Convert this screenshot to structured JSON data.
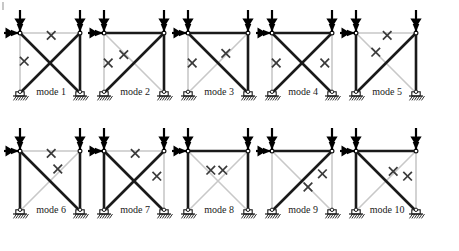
{
  "figure": {
    "kind": "truss-collapse-mode-diagram",
    "rows": 2,
    "columns": 5,
    "colors": {
      "intact_member": "#1a1a1a",
      "failed_member": "#c8c8c8",
      "failure_mark": "#3a3a3a",
      "load_arrow": "#000000",
      "background": "#ffffff",
      "support_hatch": "#1a1a1a"
    },
    "legend": {
      "failure_mark_glyph": "×",
      "failure_mark_meaning": "plastic hinge / member failure",
      "gray_member_meaning": "failed member",
      "dark_member_meaning": "intact member"
    },
    "loads": {
      "vertical_arrow_count_per_frame": 2,
      "horizontal_arrow_count_per_frame": 1,
      "vertical_label": "",
      "horizontal_label": ""
    },
    "geometry": {
      "panel_width": 84,
      "panel_height": 112,
      "bay_span": 60,
      "storey_height": 60
    }
  },
  "modes": [
    {
      "id": 1,
      "label": "mode 1",
      "members": {
        "top_beam": "failed",
        "left_column": "failed",
        "right_column": "intact",
        "diagonal_tl_br": "intact",
        "diagonal_bl_tr": "intact"
      },
      "marks": [
        {
          "on": "top_beam",
          "x": 0.52,
          "y": 0.04
        },
        {
          "on": "left_column",
          "x": 0.07,
          "y": 0.47
        }
      ]
    },
    {
      "id": 2,
      "label": "mode 2",
      "members": {
        "top_beam": "intact",
        "left_column": "failed",
        "right_column": "intact",
        "diagonal_tl_br": "failed",
        "diagonal_bl_tr": "intact"
      },
      "marks": [
        {
          "on": "left_column",
          "x": 0.07,
          "y": 0.5
        },
        {
          "on": "diagonal_tl_br",
          "x": 0.33,
          "y": 0.36
        }
      ]
    },
    {
      "id": 3,
      "label": "mode 3",
      "members": {
        "top_beam": "intact",
        "left_column": "failed",
        "right_column": "intact",
        "diagonal_tl_br": "intact",
        "diagonal_bl_tr": "failed"
      },
      "marks": [
        {
          "on": "left_column",
          "x": 0.07,
          "y": 0.5
        },
        {
          "on": "diagonal_bl_tr",
          "x": 0.63,
          "y": 0.34
        }
      ]
    },
    {
      "id": 4,
      "label": "mode 4",
      "members": {
        "top_beam": "intact",
        "left_column": "failed",
        "right_column": "failed",
        "diagonal_tl_br": "intact",
        "diagonal_bl_tr": "intact"
      },
      "marks": [
        {
          "on": "left_column",
          "x": 0.07,
          "y": 0.5
        },
        {
          "on": "right_column",
          "x": 0.88,
          "y": 0.5
        }
      ]
    },
    {
      "id": 5,
      "label": "mode 5",
      "members": {
        "top_beam": "failed",
        "left_column": "intact",
        "right_column": "intact",
        "diagonal_tl_br": "failed",
        "diagonal_bl_tr": "intact"
      },
      "marks": [
        {
          "on": "top_beam",
          "x": 0.52,
          "y": 0.04
        },
        {
          "on": "diagonal_tl_br",
          "x": 0.33,
          "y": 0.32
        }
      ]
    },
    {
      "id": 6,
      "label": "mode 6",
      "members": {
        "top_beam": "failed",
        "left_column": "intact",
        "right_column": "intact",
        "diagonal_tl_br": "intact",
        "diagonal_bl_tr": "failed"
      },
      "marks": [
        {
          "on": "top_beam",
          "x": 0.52,
          "y": 0.04
        },
        {
          "on": "diagonal_bl_tr",
          "x": 0.63,
          "y": 0.3
        }
      ]
    },
    {
      "id": 7,
      "label": "mode 7",
      "members": {
        "top_beam": "failed",
        "left_column": "intact",
        "right_column": "failed",
        "diagonal_tl_br": "intact",
        "diagonal_bl_tr": "intact"
      },
      "marks": [
        {
          "on": "top_beam",
          "x": 0.52,
          "y": 0.04
        },
        {
          "on": "right_column",
          "x": 0.88,
          "y": 0.42
        }
      ]
    },
    {
      "id": 8,
      "label": "mode 8",
      "members": {
        "top_beam": "intact",
        "left_column": "intact",
        "right_column": "intact",
        "diagonal_tl_br": "failed",
        "diagonal_bl_tr": "failed"
      },
      "marks": [
        {
          "on": "diagonal_tl_br",
          "x": 0.38,
          "y": 0.32
        },
        {
          "on": "diagonal_bl_tr",
          "x": 0.58,
          "y": 0.32
        }
      ]
    },
    {
      "id": 9,
      "label": "mode 9",
      "members": {
        "top_beam": "intact",
        "left_column": "failed",
        "right_column": "failed",
        "diagonal_tl_br": "failed",
        "diagonal_bl_tr": "intact"
      },
      "marks": [
        {
          "on": "right_column",
          "x": 0.84,
          "y": 0.38
        },
        {
          "on": "diagonal_tl_br",
          "x": 0.6,
          "y": 0.6
        }
      ]
    },
    {
      "id": 10,
      "label": "mode 10",
      "members": {
        "top_beam": "intact",
        "left_column": "intact",
        "right_column": "failed",
        "diagonal_tl_br": "intact",
        "diagonal_bl_tr": "failed"
      },
      "marks": [
        {
          "on": "diagonal_bl_tr",
          "x": 0.62,
          "y": 0.34
        },
        {
          "on": "right_column",
          "x": 0.86,
          "y": 0.42
        }
      ]
    }
  ]
}
